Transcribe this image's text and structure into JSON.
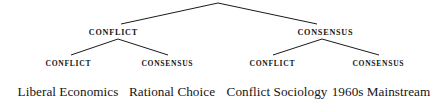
{
  "diagram": {
    "type": "binary-tree",
    "background_color": "#ffffff",
    "line_color": "#1a1a1a",
    "text_color": "#151515",
    "root": {
      "label": "",
      "x": 218,
      "y": 3
    },
    "level1": [
      {
        "label": "CONFLICT",
        "x": 113,
        "y": 33
      },
      {
        "label": "CONSENSUS",
        "x": 325,
        "y": 33
      }
    ],
    "level2": [
      {
        "label": "CONFLICT",
        "x": 68,
        "y": 64
      },
      {
        "label": "CONSENSUS",
        "x": 167,
        "y": 64
      },
      {
        "label": "CONFLICT",
        "x": 272,
        "y": 64
      },
      {
        "label": "CONSENSUS",
        "x": 378,
        "y": 64
      }
    ],
    "leaves": [
      {
        "label": "Liberal Economics",
        "x": 68,
        "y": 92
      },
      {
        "label": "Rational Choice",
        "x": 172,
        "y": 92
      },
      {
        "label": "Conflict Sociology",
        "x": 277,
        "y": 92
      },
      {
        "label": "1960s Mainstream",
        "x": 381,
        "y": 92
      }
    ],
    "edges": [
      {
        "name": "root-to-conflict",
        "x1": 218,
        "y1": 3,
        "x2": 121,
        "y2": 24
      },
      {
        "name": "root-to-consensus",
        "x1": 218,
        "y1": 3,
        "x2": 317,
        "y2": 24
      },
      {
        "name": "conflict-to-conflict",
        "x1": 118,
        "y1": 39,
        "x2": 71,
        "y2": 55
      },
      {
        "name": "conflict-to-consensus",
        "x1": 118,
        "y1": 39,
        "x2": 168,
        "y2": 55
      },
      {
        "name": "consensus-to-conflict",
        "x1": 322,
        "y1": 39,
        "x2": 273,
        "y2": 55
      },
      {
        "name": "consensus-to-consensus",
        "x1": 322,
        "y1": 39,
        "x2": 379,
        "y2": 55
      }
    ]
  }
}
